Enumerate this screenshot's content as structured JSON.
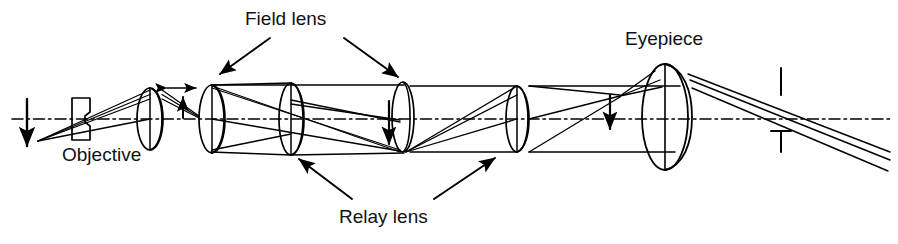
{
  "figure": {
    "type": "optical-ray-diagram",
    "background_color": "#ffffff",
    "line_color": "#000000",
    "width": 898,
    "height": 244
  },
  "labels": {
    "field_lens": "Field lens",
    "eyepiece": "Eyepiece",
    "objective": "Objective",
    "relay_lens": "Relay lens"
  },
  "optical_axis": {
    "name": "optical-axis",
    "style": "dash-dot",
    "y": 119,
    "x_start": 12,
    "x_end": 890
  },
  "elements": [
    {
      "name": "object-arrow",
      "kind": "arrow",
      "label": "object",
      "x": 27,
      "y_from": 100,
      "y_to": 148,
      "direction": "down"
    },
    {
      "name": "field-stop-block",
      "kind": "aperture",
      "x": 72,
      "y": 98,
      "w": 18,
      "h": 42
    },
    {
      "name": "objective-lens",
      "kind": "lens",
      "x": 150,
      "y": 119,
      "rx": 13,
      "ry": 31,
      "thickness": 10
    },
    {
      "name": "field-lens-1",
      "kind": "lens",
      "x": 212,
      "y": 119,
      "rx": 13,
      "ry": 33,
      "thickness": 9
    },
    {
      "name": "relay-lens-1",
      "kind": "lens",
      "x": 291,
      "y": 119,
      "rx": 12,
      "ry": 36,
      "thickness": 11
    },
    {
      "name": "field-lens-2",
      "kind": "lens",
      "x": 403,
      "y": 117,
      "rx": 11,
      "ry": 33,
      "thickness": 3
    },
    {
      "name": "relay-lens-2",
      "kind": "lens",
      "x": 517,
      "y": 119,
      "rx": 11,
      "ry": 33,
      "thickness": 10
    },
    {
      "name": "eyepiece-lens",
      "kind": "lens",
      "x": 672,
      "y": 117,
      "rx": 24,
      "ry": 53,
      "thickness": 17
    },
    {
      "name": "intermediate-image-arrow-1",
      "kind": "arrow",
      "x": 188,
      "y_from": 123,
      "y_to": 100,
      "direction": "up"
    },
    {
      "name": "intermediate-image-arrow-2",
      "kind": "arrow",
      "x": 389,
      "y_from": 100,
      "y_to": 145,
      "direction": "down"
    },
    {
      "name": "intermediate-image-arrow-3",
      "kind": "arrow",
      "x": 610,
      "y_from": 94,
      "y_to": 130,
      "direction": "down"
    },
    {
      "name": "separation-double-arrow",
      "kind": "double-arrow",
      "x_from": 165,
      "x_to": 198,
      "y": 88
    },
    {
      "name": "exit-pupil-tick-upper",
      "kind": "tick",
      "x": 781,
      "y_from": 68,
      "y_to": 95
    },
    {
      "name": "exit-pupil-tick-lower",
      "kind": "tick-t",
      "x": 781,
      "y_from": 130,
      "y_to": 152
    }
  ],
  "callouts": [
    {
      "name": "callout-field-lens-left",
      "from_label": "field_lens",
      "to_element": "field-lens-1",
      "x1": 268,
      "y1": 38,
      "x2": 219,
      "y2": 73
    },
    {
      "name": "callout-field-lens-right",
      "from_label": "field_lens",
      "to_element": "field-lens-2",
      "x1": 341,
      "y1": 38,
      "x2": 397,
      "y2": 78
    },
    {
      "name": "callout-relay-lens-left",
      "from_label": "relay_lens",
      "to_element": "relay-lens-1",
      "x1": 350,
      "y1": 200,
      "x2": 298,
      "y2": 158
    },
    {
      "name": "callout-relay-lens-right",
      "from_label": "relay_lens",
      "to_element": "relay-lens-2",
      "x1": 435,
      "y1": 200,
      "x2": 496,
      "y2": 157
    }
  ],
  "ray_bundles": {
    "count_per_bundle": 3,
    "description": "Three-ray bundles traced from object through objective, field lens, two relay lenses, second field lens and eyepiece to exit pupil."
  }
}
